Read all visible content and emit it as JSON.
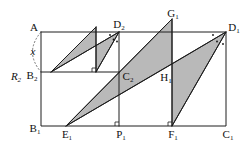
{
  "figure": {
    "type": "geometry-diagram",
    "colors": {
      "stroke": "#1e1e1e",
      "shade": "#b9b9b9",
      "arc": "#555555"
    },
    "labels": {
      "A": {
        "main": "A",
        "sub": ""
      },
      "D2": {
        "main": "D",
        "sub": "2"
      },
      "G1": {
        "main": "G",
        "sub": "1"
      },
      "D1": {
        "main": "D",
        "sub": "1"
      },
      "x": {
        "main": "x",
        "sub": ""
      },
      "R2": {
        "main": "R",
        "sub": "2"
      },
      "B2": {
        "main": "B",
        "sub": "2"
      },
      "C2": {
        "main": "C",
        "sub": "2"
      },
      "H1": {
        "main": "H",
        "sub": "1"
      },
      "B1": {
        "main": "B",
        "sub": "1"
      },
      "E1": {
        "main": "E",
        "sub": "1"
      },
      "P1": {
        "main": "P",
        "sub": "1"
      },
      "F1": {
        "main": "F",
        "sub": "1"
      },
      "C1": {
        "main": "C",
        "sub": "1"
      }
    },
    "points": {
      "A": [
        41,
        32
      ],
      "D2": [
        119,
        32
      ],
      "G1": [
        172,
        19
      ],
      "D1": [
        226,
        32
      ],
      "B2": [
        41,
        72
      ],
      "C2": [
        119,
        72
      ],
      "H1": [
        172,
        64
      ],
      "B1": [
        41,
        126
      ],
      "E1": [
        66,
        126
      ],
      "P1": [
        119,
        126
      ],
      "F1": [
        172,
        126
      ],
      "C1": [
        226,
        126
      ]
    },
    "shaded_triangles": {
      "t1": "51,72 96,27 96,45.5",
      "t2": "96,45.5 119,32 96,72",
      "t3": "66,126 172,19 172,64",
      "t4": "172,64 226,32 172,126"
    },
    "segments": {
      "outer_rect": "41,32 226,32 226,126 41,126 41,32",
      "B2C2": "41,72 119,72",
      "D2P1": "119,32 119,126",
      "small_vertical": "96,27 96,72",
      "small_hyp": "51,72 96,27",
      "to_D2": "51,72 119,32",
      "D2_to_foot": "119,32 96,72",
      "E1G1": "66,126 172,19",
      "G1F1": "172,19 172,126",
      "E1D1": "66,126 226,32",
      "D1F1": "226,32 172,126"
    },
    "right_angles": {
      "foot": "92,72 92,68 96,68",
      "P1": "115,126 115,122 119,122",
      "F1": "168,126 168,122 172,122"
    },
    "arc": "M41,32 Q24,52 41,72"
  }
}
